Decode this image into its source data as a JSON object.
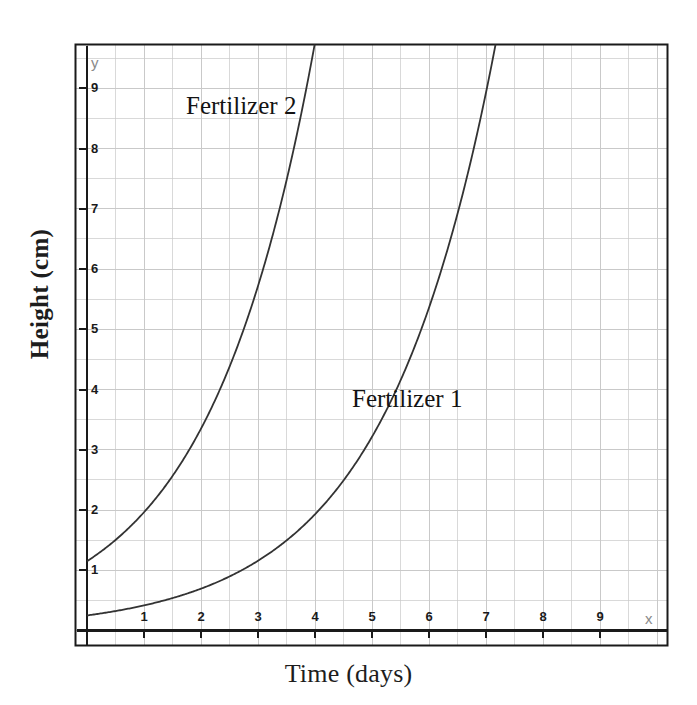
{
  "chart_data": {
    "type": "line",
    "title": "",
    "xlabel": "Time (days)",
    "ylabel": "Height (cm)",
    "xlim": [
      0,
      10.2
    ],
    "ylim": [
      0,
      9.97
    ],
    "xticks": [
      1,
      2,
      3,
      4,
      5,
      6,
      7,
      8,
      9
    ],
    "yticks": [
      1,
      2,
      3,
      4,
      5,
      6,
      7,
      8,
      9
    ],
    "xtick_labels": [
      "1",
      "2",
      "3",
      "4",
      "5",
      "6",
      "7",
      "8",
      "9"
    ],
    "ytick_labels": [
      "1",
      "2",
      "3",
      "4",
      "5",
      "6",
      "7",
      "8",
      "9"
    ],
    "x_axis_letter": "x",
    "y_axis_letter": "y",
    "grid": true,
    "grid_minor_step": 0.5,
    "legend_position": "inline-annotations",
    "line_color": "#333333",
    "grid_color": "#c9c9c9",
    "frame_color": "#1a1a1a",
    "background": "#ffffff",
    "series": [
      {
        "name": "Fertilizer 1",
        "annotation": "Fertilizer 1",
        "model": "exponential",
        "a": 0.25,
        "b": 0.5108,
        "x": [
          0,
          0.5,
          1,
          1.5,
          2,
          2.5,
          3,
          3.5,
          4,
          4.5,
          5,
          5.5,
          6,
          6.25
        ],
        "values": [
          0.25,
          0.32,
          0.42,
          0.54,
          0.69,
          0.9,
          1.16,
          1.49,
          1.93,
          2.49,
          3.21,
          4.14,
          5.34,
          6.06
        ]
      },
      {
        "name": "Fertilizer 2",
        "annotation": "Fertilizer 2",
        "model": "exponential",
        "a": 1.15,
        "b": 0.5346,
        "x": [
          0,
          0.5,
          1,
          1.5,
          2,
          2.5,
          3,
          3.5,
          4,
          4.05
        ],
        "values": [
          1.15,
          1.5,
          1.96,
          2.56,
          3.35,
          4.37,
          5.71,
          7.46,
          9.74,
          10.0
        ]
      }
    ],
    "intersection": {
      "x": 2.5,
      "y": 1.75
    }
  },
  "axes": {
    "x_title": "Time (days)",
    "y_title": "Height (cm)",
    "x_letter": "x",
    "y_letter": "y"
  },
  "annotations": {
    "fertilizer_1": "Fertilizer 1",
    "fertilizer_2": "Fertilizer 2"
  }
}
